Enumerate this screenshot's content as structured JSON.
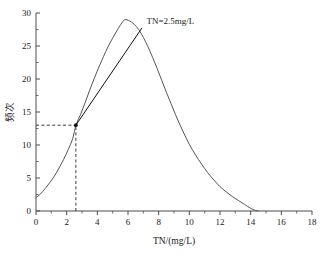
{
  "chart_data": {
    "type": "line",
    "title": "",
    "xlabel": "TN/(mg/L)",
    "ylabel": "频次",
    "xlim": [
      0,
      18
    ],
    "ylim": [
      0,
      30
    ],
    "xticks": [
      0,
      2,
      4,
      6,
      8,
      10,
      12,
      14,
      16,
      18
    ],
    "xtick_labels": [
      "0",
      "2",
      "4",
      "6",
      "8",
      "10",
      "12",
      "14",
      "16",
      "18"
    ],
    "yticks": [
      0,
      5,
      10,
      15,
      20,
      25,
      30
    ],
    "ytick_labels": [
      "0",
      "5",
      "10",
      "15",
      "20",
      "25",
      "30"
    ],
    "minor_ticks": true,
    "grid": false,
    "legend": "none",
    "series": [
      {
        "name": "frequency-distribution",
        "kind": "curve",
        "points": [
          [
            0.0,
            2.0
          ],
          [
            0.3,
            2.6
          ],
          [
            0.6,
            3.4
          ],
          [
            0.9,
            4.3
          ],
          [
            1.2,
            5.3
          ],
          [
            1.5,
            6.5
          ],
          [
            1.8,
            7.8
          ],
          [
            2.1,
            9.3
          ],
          [
            2.4,
            11.0
          ],
          [
            2.6,
            13.0
          ],
          [
            2.9,
            14.6
          ],
          [
            3.2,
            16.4
          ],
          [
            3.5,
            18.3
          ],
          [
            3.8,
            20.1
          ],
          [
            4.1,
            21.8
          ],
          [
            4.4,
            23.4
          ],
          [
            4.7,
            24.9
          ],
          [
            5.0,
            26.2
          ],
          [
            5.3,
            27.4
          ],
          [
            5.6,
            28.5
          ],
          [
            5.8,
            29.0
          ],
          [
            6.1,
            28.8
          ],
          [
            6.4,
            28.3
          ],
          [
            6.7,
            27.5
          ],
          [
            7.0,
            26.3
          ],
          [
            7.3,
            24.9
          ],
          [
            7.6,
            23.3
          ],
          [
            7.9,
            21.6
          ],
          [
            8.2,
            19.8
          ],
          [
            8.5,
            18.0
          ],
          [
            8.8,
            16.3
          ],
          [
            9.1,
            14.6
          ],
          [
            9.4,
            13.0
          ],
          [
            9.7,
            11.5
          ],
          [
            10.0,
            10.1
          ],
          [
            10.4,
            8.5
          ],
          [
            10.8,
            7.1
          ],
          [
            11.2,
            5.8
          ],
          [
            11.6,
            4.7
          ],
          [
            12.0,
            3.7
          ],
          [
            12.4,
            2.9
          ],
          [
            12.8,
            2.2
          ],
          [
            13.2,
            1.6
          ],
          [
            13.6,
            1.0
          ],
          [
            14.0,
            0.4
          ],
          [
            14.3,
            0.1
          ],
          [
            14.5,
            0.0
          ]
        ]
      },
      {
        "name": "tangent-line",
        "kind": "line",
        "points": [
          [
            2.6,
            13.0
          ],
          [
            6.9,
            27.7
          ]
        ]
      }
    ],
    "annotations": [
      {
        "name": "tn-threshold-label",
        "text": "TN=2.5mg/L",
        "x": 7.2,
        "y": 28.4
      }
    ],
    "markers": [
      {
        "name": "inflection-point",
        "x": 2.6,
        "y": 13.0
      }
    ],
    "guides": [
      {
        "name": "horizontal-guide",
        "orientation": "horizontal",
        "from": [
          0.0,
          13.0
        ],
        "to": [
          2.6,
          13.0
        ],
        "style": "dashed"
      },
      {
        "name": "vertical-guide",
        "orientation": "vertical",
        "from": [
          2.6,
          0.0
        ],
        "to": [
          2.6,
          13.0
        ],
        "style": "dashed"
      }
    ]
  },
  "colors": {
    "curve": "#555555",
    "tangent": "#111111",
    "axis": "#4d4d4d",
    "text": "#1a1a1a",
    "background": "#ffffff"
  }
}
